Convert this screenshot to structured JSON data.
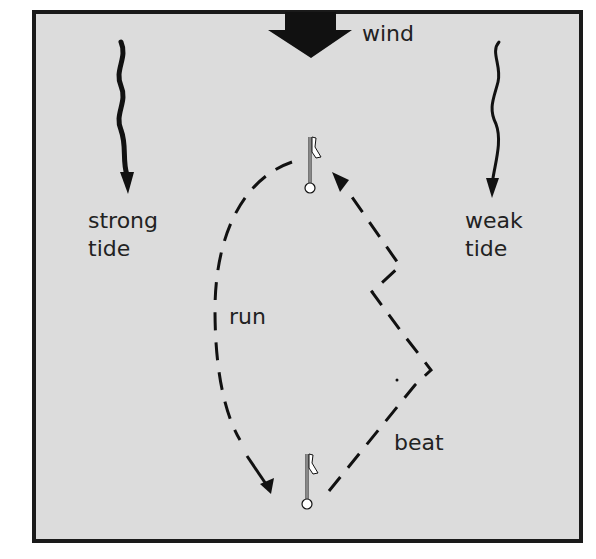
{
  "diagram": {
    "labels": {
      "wind": "wind",
      "strong_tide": [
        "strong",
        "tide"
      ],
      "weak_tide": [
        "weak",
        "tide"
      ],
      "run": "run",
      "beat": "beat"
    },
    "colors": {
      "background": "#dcdcdc",
      "border": "#1a1a1a",
      "ink": "#111111",
      "mark": "#ffffff"
    },
    "elements": [
      {
        "type": "wind-arrow",
        "direction": "down"
      },
      {
        "type": "tide-arrow",
        "strength": "strong",
        "side": "left"
      },
      {
        "type": "tide-arrow",
        "strength": "weak",
        "side": "right"
      },
      {
        "type": "mark",
        "position": "windward"
      },
      {
        "type": "mark",
        "position": "leeward"
      },
      {
        "type": "course-leg",
        "name": "run",
        "style": "dashed"
      },
      {
        "type": "course-leg",
        "name": "beat",
        "style": "dashed"
      }
    ]
  }
}
